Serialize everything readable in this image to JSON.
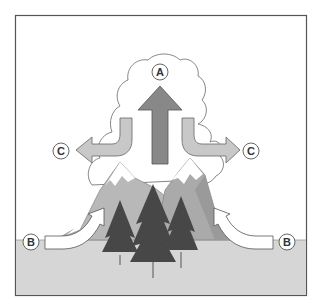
{
  "diagram": {
    "type": "orographic-cloud-formation",
    "labels": {
      "A": "A",
      "B_left": "B",
      "B_right": "B",
      "C_left": "C",
      "C_right": "C"
    },
    "components": {
      "cloud": "cumulus cloud above mountains",
      "up_arrow": "rising air (A)",
      "side_arrows": "air spreading outward (C)",
      "inflow_arrows": "air pushed up mountain slopes (B)",
      "mountains": "two snow-capped peaks",
      "trees": "three evergreen trees",
      "ground": "flat ground"
    },
    "colors": {
      "frame": "#555555",
      "background": "#ffffff",
      "ground": "#d4d4d4",
      "cloud_fill": "#ffffff",
      "cloud_stroke": "#666666",
      "up_arrow": "#888888",
      "side_arrow": "#c8c8c8",
      "inflow_arrow": "#ffffff",
      "mountain": "#b5b5b5",
      "mountain_shade": "#9e9e9e",
      "snow": "#ffffff",
      "tree": "#4a4a4a",
      "label_circle": "#ffffff"
    }
  }
}
